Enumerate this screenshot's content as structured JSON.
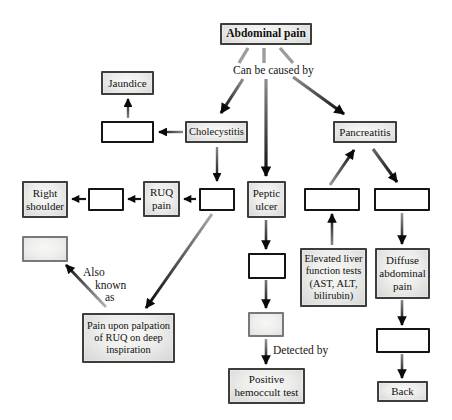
{
  "diagram": {
    "type": "flowchart",
    "topic": "Abdominal pain differential diagnosis concept map",
    "nodes": {
      "abdominal_pain": "Abdominal pain",
      "jaundice": "Jaundice",
      "cholecystitis": "Cholecystitis",
      "pancreatitis": "Pancreatitis",
      "right_shoulder": "Right shoulder",
      "ruq_pain": "RUQ pain",
      "peptic_ulcer": "Peptic ulcer",
      "pain_upon_palpation": "Pain upon palpation of RUQ on deep inspiration",
      "positive_hemoccult": "Positive hemoccult test",
      "elevated_liver": "Elevated liver function tests (AST, ALT, bilirubin)",
      "diffuse_abdominal_pain": "Diffuse abdominal pain",
      "back": "Back"
    },
    "blank_boxes": [
      {
        "id": "blank_cause_jaundice",
        "fill": "white"
      },
      {
        "id": "blank_right_shoulder_link",
        "fill": "white"
      },
      {
        "id": "blank_under_cholecystitis",
        "fill": "white"
      },
      {
        "id": "blank_gray_left",
        "fill": "gray"
      },
      {
        "id": "blank_below_peptic",
        "fill": "white"
      },
      {
        "id": "blank_gray_middle",
        "fill": "gray"
      },
      {
        "id": "blank_pancreatitis_left",
        "fill": "white"
      },
      {
        "id": "blank_pancreatitis_right",
        "fill": "white"
      },
      {
        "id": "blank_below_diffuse",
        "fill": "white"
      }
    ],
    "labels": {
      "can_be_caused_by": "Can be caused by",
      "also_known_as": "Also known as",
      "also_known_as_lines": [
        "Also",
        "known",
        "as"
      ],
      "detected_by": "Detected by"
    },
    "edges": [
      {
        "from": "abdominal_pain",
        "to": "cholecystitis",
        "label": "Can be caused by"
      },
      {
        "from": "abdominal_pain",
        "to": "peptic_ulcer",
        "label": "Can be caused by"
      },
      {
        "from": "abdominal_pain",
        "to": "pancreatitis",
        "label": "Can be caused by"
      },
      {
        "from": "cholecystitis",
        "to": "blank_cause_jaundice",
        "label": ""
      },
      {
        "from": "blank_cause_jaundice",
        "to": "jaundice",
        "label": ""
      },
      {
        "from": "cholecystitis",
        "to": "blank_under_cholecystitis",
        "label": ""
      },
      {
        "from": "blank_under_cholecystitis",
        "to": "ruq_pain",
        "label": ""
      },
      {
        "from": "ruq_pain",
        "to": "blank_right_shoulder_link",
        "label": ""
      },
      {
        "from": "blank_right_shoulder_link",
        "to": "right_shoulder",
        "label": ""
      },
      {
        "from": "blank_under_cholecystitis",
        "to": "pain_upon_palpation",
        "label": ""
      },
      {
        "from": "pain_upon_palpation",
        "to": "blank_gray_left",
        "label": "Also known as"
      },
      {
        "from": "peptic_ulcer",
        "to": "blank_below_peptic",
        "label": ""
      },
      {
        "from": "blank_below_peptic",
        "to": "blank_gray_middle",
        "label": ""
      },
      {
        "from": "blank_gray_middle",
        "to": "positive_hemoccult",
        "label": "Detected by"
      },
      {
        "from": "blank_pancreatitis_left",
        "to": "pancreatitis",
        "label": ""
      },
      {
        "from": "elevated_liver",
        "to": "blank_pancreatitis_left",
        "label": ""
      },
      {
        "from": "pancreatitis",
        "to": "blank_pancreatitis_right",
        "label": ""
      },
      {
        "from": "blank_pancreatitis_right",
        "to": "diffuse_abdominal_pain",
        "label": ""
      },
      {
        "from": "diffuse_abdominal_pain",
        "to": "blank_below_diffuse",
        "label": ""
      },
      {
        "from": "blank_below_diffuse",
        "to": "back",
        "label": ""
      }
    ],
    "colors": {
      "background": "#ffffff",
      "node_fill_light": "#f8f8f6",
      "node_fill_dark": "#d5d5d3",
      "node_border": "#3d3d3d",
      "blank_white_border": "#141414",
      "blank_gray_border": "#787878",
      "arrow_black": "#0a0a0a",
      "arrow_gray": "#9c9c9c",
      "text": "#111111"
    }
  }
}
